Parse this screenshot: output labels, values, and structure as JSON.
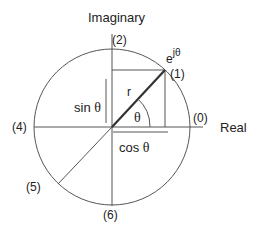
{
  "diagram": {
    "axes": {
      "imaginary_label": "Imaginary",
      "real_label": "Real"
    },
    "points": [
      {
        "id": "p0",
        "label": "(0)"
      },
      {
        "id": "p1",
        "label": "(1)"
      },
      {
        "id": "p2",
        "label": "(2)"
      },
      {
        "id": "p4",
        "label": "(4)"
      },
      {
        "id": "p5",
        "label": "(5)"
      },
      {
        "id": "p6",
        "label": "(6)"
      }
    ],
    "labels": {
      "phasor_base": "e",
      "phasor_exp": "jθ",
      "radius": "r",
      "angle": "θ",
      "sin_fn": "sin",
      "sin_arg": "θ",
      "cos_fn": "cos",
      "cos_arg": "θ"
    },
    "colors": {
      "line": "#444444",
      "phasor": "#333333",
      "text": "#222222"
    }
  }
}
